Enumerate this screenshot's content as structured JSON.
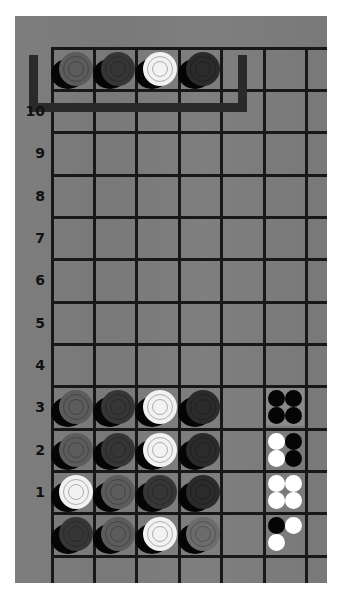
{
  "game": {
    "title": "Mastermind",
    "columns": 4,
    "rows_total": 10,
    "colors": {
      "board": "#7b7b7b",
      "grid_line": "#181818",
      "bracket": "#2a2a2a",
      "peg_white": "#f2f2f2",
      "peg_gray": "#5c5c5c",
      "peg_light_gray": "#6c6c6c",
      "peg_dark": "#363636",
      "peg_darker": "#2b2b2b",
      "feedback_black": "#050505",
      "feedback_white": "#ffffff"
    }
  },
  "row_labels": [
    "10",
    "9",
    "8",
    "7",
    "6",
    "5",
    "4",
    "3",
    "2",
    "1"
  ],
  "secret_code": {
    "revealed": true,
    "pegs": [
      "gray",
      "dark",
      "white",
      "darker"
    ]
  },
  "guesses": [
    {
      "row": "1",
      "pegs": [
        "dark",
        "gray",
        "white",
        "light_gray"
      ],
      "feedback": {
        "black": 1,
        "white": 2
      }
    },
    {
      "row": "2",
      "pegs": [
        "white",
        "gray",
        "dark",
        "darker"
      ],
      "feedback": {
        "black": 0,
        "white": 4
      }
    },
    {
      "row": "3",
      "pegs": [
        "gray",
        "dark",
        "white",
        "darker"
      ],
      "feedback": {
        "black": 2,
        "white": 2,
        "layout": [
          "white",
          "black",
          "white",
          "black"
        ]
      }
    },
    {
      "row": "4",
      "pegs": [
        "gray",
        "dark",
        "white",
        "darker"
      ],
      "feedback": {
        "black": 4,
        "white": 0
      }
    }
  ],
  "status": {
    "solved": true,
    "guesses_used": 4
  }
}
